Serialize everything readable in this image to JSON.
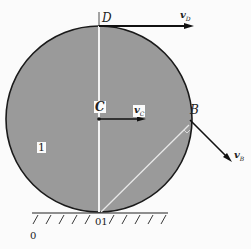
{
  "figure": {
    "points": {
      "D": "D",
      "C": "C",
      "B": "B",
      "contact": "01",
      "ground_origin": "0"
    },
    "body_label": "1",
    "vectors": {
      "vD": {
        "main": "v",
        "sub": "D"
      },
      "vC": {
        "main": "v",
        "sub": "C"
      },
      "vB": {
        "main": "v",
        "sub": "B"
      }
    },
    "colors": {
      "disk_fill": "#9a9a9a",
      "outline": "#1a1a1a",
      "background": "#fbfbfb",
      "radius_line": "#f2f2f2"
    }
  }
}
